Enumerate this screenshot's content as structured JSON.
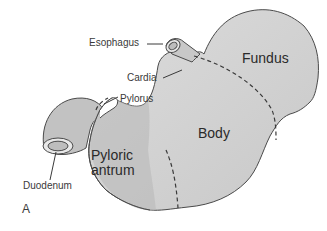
{
  "diagram": {
    "panel_letter": "A",
    "colors": {
      "organ_fill": "#c4c4c4",
      "organ_fill_light": "#d6d6d6",
      "outline": "#4a4a4a",
      "label_text": "#3a3a3a",
      "background": "#ffffff"
    },
    "callout_labels": {
      "esophagus": "Esophagus",
      "cardia": "Cardia",
      "pylorus": "Pylorus",
      "duodenum": "Duodenum"
    },
    "region_labels": {
      "fundus": "Fundus",
      "body": "Body",
      "pyloric_antrum_line1": "Pyloric",
      "pyloric_antrum_line2": "antrum"
    }
  }
}
